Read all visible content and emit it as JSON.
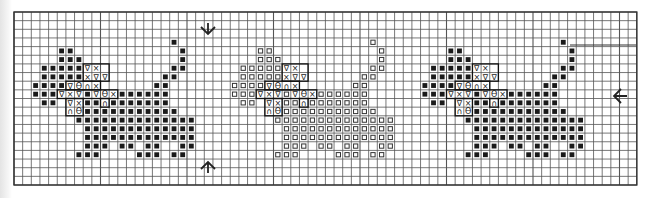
{
  "chart_data": {
    "type": "cross-stitch-chart",
    "title": "",
    "grid": {
      "origin_x": 14,
      "origin_y": 12,
      "cell_w": 8.65,
      "cell_h": 8.65,
      "cols": 72,
      "rows": 20,
      "grid_color": "#555555",
      "border_color": "#333333"
    },
    "symbols": {
      "B": {
        "name": "filled-square",
        "color": "#1a1a1a"
      },
      "O": {
        "name": "open-square",
        "color": "#333333"
      },
      "V": {
        "name": "triangle-down",
        "glyph": "∇"
      },
      "X": {
        "name": "cross",
        "glyph": "×"
      },
      "T": {
        "name": "theta",
        "glyph": "ϴ"
      },
      "N": {
        "name": "arch",
        "glyph": "∩"
      }
    },
    "motif": [
      {
        "row": 3,
        "cells": [
          [
            18,
            "B"
          ]
        ]
      },
      {
        "row": 4,
        "cells": [
          [
            5,
            "B"
          ],
          [
            6,
            "B"
          ],
          [
            19,
            "B"
          ]
        ]
      },
      {
        "row": 5,
        "cells": [
          [
            5,
            "B"
          ],
          [
            6,
            "B"
          ],
          [
            7,
            "B"
          ],
          [
            19,
            "B"
          ]
        ]
      },
      {
        "row": 6,
        "cells": [
          [
            3,
            "B"
          ],
          [
            4,
            "B"
          ],
          [
            5,
            "B"
          ],
          [
            6,
            "B"
          ],
          [
            7,
            "B"
          ],
          [
            8,
            "V"
          ],
          [
            9,
            "X"
          ],
          [
            18,
            "B"
          ],
          [
            19,
            "B"
          ]
        ]
      },
      {
        "row": 7,
        "cells": [
          [
            3,
            "B"
          ],
          [
            4,
            "B"
          ],
          [
            5,
            "B"
          ],
          [
            6,
            "B"
          ],
          [
            7,
            "B"
          ],
          [
            8,
            "X"
          ],
          [
            9,
            "V"
          ],
          [
            10,
            "V"
          ],
          [
            17,
            "B"
          ],
          [
            18,
            "B"
          ]
        ]
      },
      {
        "row": 8,
        "cells": [
          [
            2,
            "B"
          ],
          [
            3,
            "B"
          ],
          [
            4,
            "B"
          ],
          [
            5,
            "B"
          ],
          [
            6,
            "V"
          ],
          [
            7,
            "T"
          ],
          [
            8,
            "N"
          ],
          [
            9,
            "X"
          ],
          [
            16,
            "B"
          ],
          [
            17,
            "B"
          ]
        ]
      },
      {
        "row": 9,
        "cells": [
          [
            2,
            "B"
          ],
          [
            3,
            "B"
          ],
          [
            4,
            "B"
          ],
          [
            5,
            "V"
          ],
          [
            6,
            "X"
          ],
          [
            7,
            "V"
          ],
          [
            8,
            "B"
          ],
          [
            9,
            "V"
          ],
          [
            10,
            "T"
          ],
          [
            11,
            "X"
          ],
          [
            12,
            "B"
          ],
          [
            13,
            "B"
          ],
          [
            14,
            "B"
          ],
          [
            15,
            "B"
          ],
          [
            16,
            "B"
          ],
          [
            17,
            "B"
          ]
        ]
      },
      {
        "row": 10,
        "cells": [
          [
            3,
            "B"
          ],
          [
            4,
            "B"
          ],
          [
            6,
            "V"
          ],
          [
            7,
            "X"
          ],
          [
            8,
            "B"
          ],
          [
            9,
            "B"
          ],
          [
            10,
            "N"
          ],
          [
            11,
            "B"
          ],
          [
            12,
            "B"
          ],
          [
            13,
            "B"
          ],
          [
            14,
            "B"
          ],
          [
            15,
            "B"
          ],
          [
            16,
            "B"
          ],
          [
            17,
            "B"
          ]
        ]
      },
      {
        "row": 11,
        "cells": [
          [
            6,
            "N"
          ],
          [
            7,
            "T"
          ],
          [
            8,
            "B"
          ],
          [
            9,
            "B"
          ],
          [
            10,
            "B"
          ],
          [
            11,
            "B"
          ],
          [
            12,
            "B"
          ],
          [
            13,
            "B"
          ],
          [
            14,
            "B"
          ],
          [
            15,
            "B"
          ],
          [
            16,
            "B"
          ],
          [
            17,
            "B"
          ],
          [
            18,
            "B"
          ]
        ]
      },
      {
        "row": 12,
        "cells": [
          [
            7,
            "B"
          ],
          [
            8,
            "B"
          ],
          [
            9,
            "B"
          ],
          [
            10,
            "B"
          ],
          [
            11,
            "B"
          ],
          [
            12,
            "B"
          ],
          [
            13,
            "B"
          ],
          [
            14,
            "B"
          ],
          [
            15,
            "B"
          ],
          [
            16,
            "B"
          ],
          [
            17,
            "B"
          ],
          [
            18,
            "B"
          ],
          [
            19,
            "B"
          ],
          [
            20,
            "B"
          ]
        ]
      },
      {
        "row": 13,
        "cells": [
          [
            8,
            "B"
          ],
          [
            9,
            "B"
          ],
          [
            10,
            "B"
          ],
          [
            11,
            "B"
          ],
          [
            12,
            "B"
          ],
          [
            13,
            "B"
          ],
          [
            14,
            "B"
          ],
          [
            15,
            "B"
          ],
          [
            16,
            "B"
          ],
          [
            17,
            "B"
          ],
          [
            18,
            "B"
          ],
          [
            19,
            "B"
          ],
          [
            20,
            "B"
          ]
        ]
      },
      {
        "row": 14,
        "cells": [
          [
            8,
            "B"
          ],
          [
            9,
            "B"
          ],
          [
            10,
            "B"
          ],
          [
            11,
            "B"
          ],
          [
            12,
            "B"
          ],
          [
            13,
            "B"
          ],
          [
            14,
            "B"
          ],
          [
            15,
            "B"
          ],
          [
            16,
            "B"
          ],
          [
            17,
            "B"
          ],
          [
            18,
            "B"
          ],
          [
            19,
            "B"
          ],
          [
            20,
            "B"
          ]
        ]
      },
      {
        "row": 15,
        "cells": [
          [
            8,
            "B"
          ],
          [
            9,
            "B"
          ],
          [
            10,
            "B"
          ],
          [
            12,
            "B"
          ],
          [
            13,
            "B"
          ],
          [
            15,
            "B"
          ],
          [
            16,
            "B"
          ],
          [
            19,
            "B"
          ],
          [
            20,
            "B"
          ]
        ]
      },
      {
        "row": 16,
        "cells": [
          [
            7,
            "B"
          ],
          [
            8,
            "B"
          ],
          [
            9,
            "B"
          ],
          [
            14,
            "B"
          ],
          [
            15,
            "B"
          ],
          [
            16,
            "B"
          ],
          [
            18,
            "B"
          ],
          [
            19,
            "B"
          ]
        ]
      }
    ],
    "outlined_regions": [
      {
        "name": "face-box-upper",
        "col0": 8,
        "row0": 6,
        "col1": 10,
        "row1": 7
      },
      {
        "name": "face-box-mid",
        "col0": 6,
        "row0": 8,
        "col1": 9,
        "row1": 8
      },
      {
        "name": "face-box-row9",
        "col0": 5,
        "row0": 9,
        "col1": 11,
        "row1": 9
      },
      {
        "name": "face-box-lower",
        "col0": 6,
        "row0": 10,
        "col1": 7,
        "row1": 11
      },
      {
        "name": "face-box-n",
        "col0": 10,
        "row0": 10,
        "col1": 10,
        "row1": 10
      }
    ],
    "instances": [
      {
        "name": "cat-1",
        "col_offset": 0,
        "fill_symbol": "B"
      },
      {
        "name": "cat-2",
        "col_offset": 23,
        "fill_symbol": "O"
      },
      {
        "name": "cat-3",
        "col_offset": 45,
        "fill_symbol": "B"
      }
    ],
    "markers": [
      {
        "name": "center-arrow-top",
        "direction": "down",
        "x": 208,
        "y": 33
      },
      {
        "name": "center-arrow-bottom",
        "direction": "up",
        "x": 208,
        "y": 163
      },
      {
        "name": "center-arrow-right",
        "direction": "left",
        "x": 615,
        "y": 96
      }
    ],
    "extra_lines": [
      {
        "name": "repeat-line",
        "x1": 570,
        "y1": 45,
        "x2": 636,
        "y2": 45
      }
    ]
  }
}
